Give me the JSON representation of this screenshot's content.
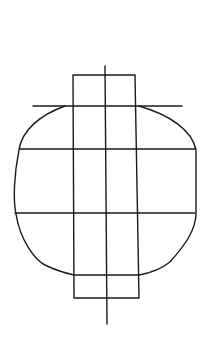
{
  "diagram": {
    "stroke_color": "#1a1a1a",
    "background": "#ffffff",
    "elements": [
      {
        "name": "rounded-body",
        "type": "closed-curve"
      },
      {
        "name": "vertical-rectangle",
        "type": "rect"
      },
      {
        "name": "center-axis",
        "type": "line"
      },
      {
        "name": "top-horizontal-line",
        "type": "line"
      },
      {
        "name": "middle-horizontal-line-1",
        "type": "line"
      },
      {
        "name": "middle-horizontal-line-2",
        "type": "line"
      }
    ]
  }
}
